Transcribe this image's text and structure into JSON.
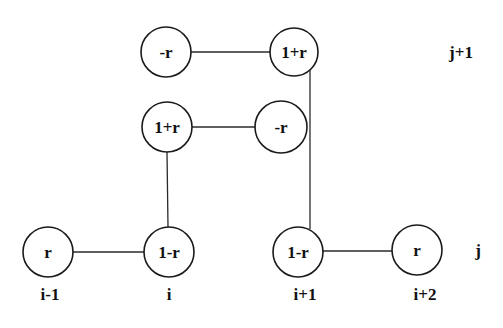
{
  "diagram": {
    "type": "finite-difference stencil",
    "nodes": [
      {
        "id": "n_top_left",
        "label": "-r",
        "cx": 166,
        "cy": 52,
        "r": 25
      },
      {
        "id": "n_top_right",
        "label": "1+r",
        "cx": 294,
        "cy": 52,
        "r": 24
      },
      {
        "id": "n_mid_left",
        "label": "1+r",
        "cx": 167,
        "cy": 127,
        "r": 25
      },
      {
        "id": "n_mid_right",
        "label": "-r",
        "cx": 281,
        "cy": 127,
        "r": 26
      },
      {
        "id": "n_bot_im1",
        "label": "r",
        "cx": 48,
        "cy": 252,
        "r": 25
      },
      {
        "id": "n_bot_i",
        "label": "1-r",
        "cx": 169,
        "cy": 252,
        "r": 25
      },
      {
        "id": "n_bot_ip1",
        "label": "1-r",
        "cx": 298,
        "cy": 252,
        "r": 25
      },
      {
        "id": "n_bot_ip2",
        "label": "r",
        "cx": 417,
        "cy": 250,
        "r": 25
      }
    ],
    "edges": [
      {
        "from": "n_top_left",
        "to": "n_top_right"
      },
      {
        "from": "n_mid_left",
        "to": "n_mid_right"
      },
      {
        "from": "n_mid_left",
        "to": "n_bot_i"
      },
      {
        "from": "n_top_right",
        "to": "n_bot_ip1"
      },
      {
        "from": "n_bot_im1",
        "to": "n_bot_i"
      },
      {
        "from": "n_bot_ip1",
        "to": "n_bot_ip2"
      }
    ],
    "column_labels": [
      {
        "label": "i-1",
        "x": 50,
        "y": 294
      },
      {
        "label": "i",
        "x": 169,
        "y": 294
      },
      {
        "label": "i+1",
        "x": 305,
        "y": 294
      },
      {
        "label": "i+2",
        "x": 425,
        "y": 294
      }
    ],
    "row_labels": [
      {
        "label": "j+1",
        "x": 461,
        "y": 52
      },
      {
        "label": "j",
        "x": 478,
        "y": 250
      }
    ]
  }
}
